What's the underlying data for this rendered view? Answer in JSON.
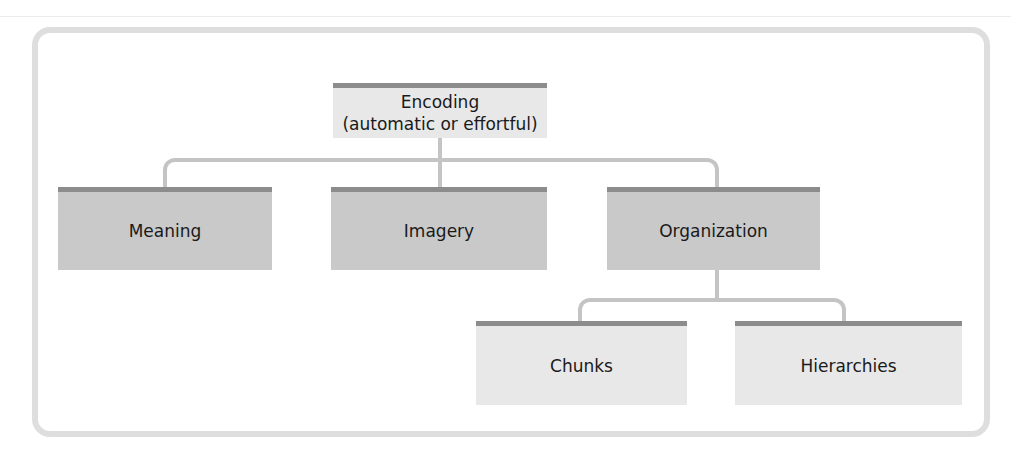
{
  "diagram": {
    "type": "hierarchy",
    "root": {
      "label_line1": "Encoding",
      "label_line2": "(automatic or effortful)"
    },
    "level1": [
      {
        "label": "Meaning"
      },
      {
        "label": "Imagery"
      },
      {
        "label": "Organization"
      }
    ],
    "level2": [
      {
        "label": "Chunks",
        "parent": "Organization"
      },
      {
        "label": "Hierarchies",
        "parent": "Organization"
      }
    ],
    "colors": {
      "frame_border": "#dedede",
      "box_top_bar": "#8c8c8c",
      "light_box_fill": "#e8e8e8",
      "dark_box_fill": "#c9c9c9",
      "connector": "#c4c4c4"
    }
  }
}
